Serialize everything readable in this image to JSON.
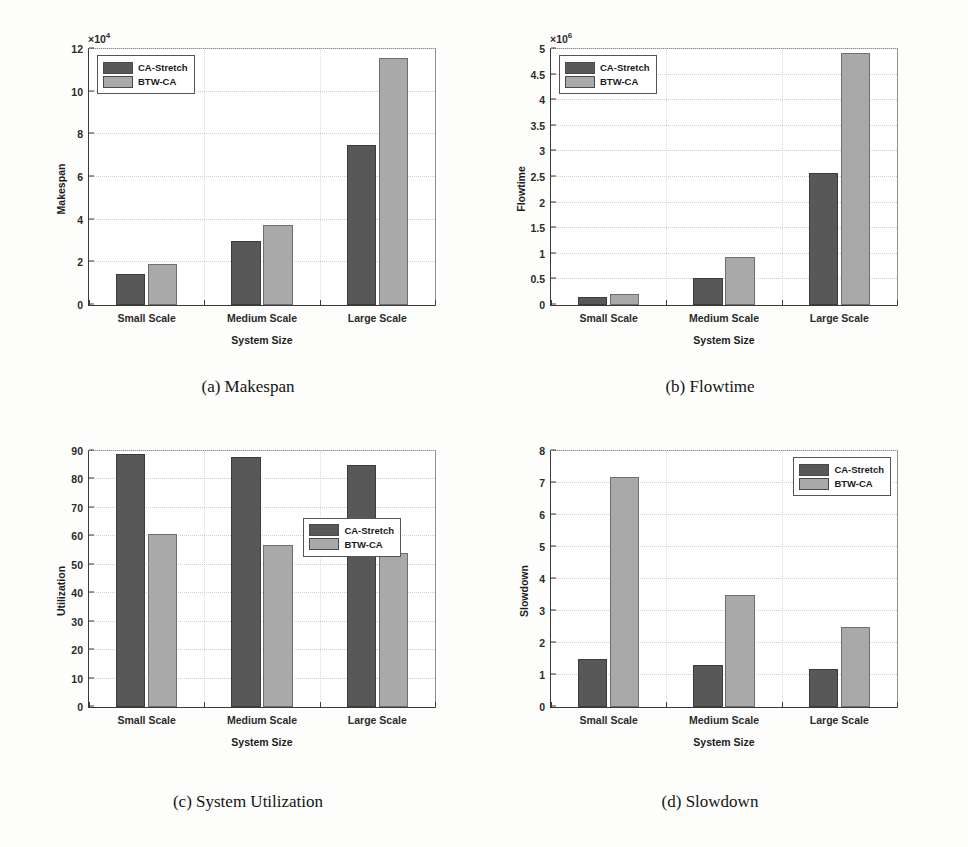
{
  "figure": {
    "panels": [
      {
        "id": "a",
        "caption": "(a) Makespan",
        "chart_data": {
          "type": "bar",
          "title": "",
          "xlabel": "System Size",
          "ylabel": "Makespan",
          "categories": [
            "Small Scale",
            "Medium Scale",
            "Large Scale"
          ],
          "series": [
            {
              "name": "CA-Stretch",
              "values": [
                14500,
                30000,
                75000
              ],
              "color": "#585858"
            },
            {
              "name": "BTW-CA",
              "values": [
                19000,
                37500,
                116000
              ],
              "color": "#a9a9a9"
            }
          ],
          "ylim": [
            0,
            120000
          ],
          "yticks": [
            0,
            20000,
            40000,
            60000,
            80000,
            100000,
            120000
          ],
          "ytick_labels": [
            "0",
            "2",
            "4",
            "6",
            "8",
            "10",
            "12"
          ],
          "y_exponent_label": "×10",
          "y_exponent_value": "4",
          "grid": true,
          "legend_position": "top-left"
        }
      },
      {
        "id": "b",
        "caption": "(b) Flowtime",
        "chart_data": {
          "type": "bar",
          "title": "",
          "xlabel": "System Size",
          "ylabel": "Flowtime",
          "categories": [
            "Small Scale",
            "Medium Scale",
            "Large Scale"
          ],
          "series": [
            {
              "name": "CA-Stretch",
              "values": [
                160000,
                530000,
                2580000
              ],
              "color": "#585858"
            },
            {
              "name": "BTW-CA",
              "values": [
                220000,
                940000,
                4920000
              ],
              "color": "#a9a9a9"
            }
          ],
          "ylim": [
            0,
            5000000
          ],
          "yticks": [
            0,
            500000,
            1000000,
            1500000,
            2000000,
            2500000,
            3000000,
            3500000,
            4000000,
            4500000,
            5000000
          ],
          "ytick_labels": [
            "0",
            "0.5",
            "1",
            "1.5",
            "2",
            "2.5",
            "3",
            "3.5",
            "4",
            "4.5",
            "5"
          ],
          "y_exponent_label": "×10",
          "y_exponent_value": "6",
          "grid": true,
          "legend_position": "top-left"
        }
      },
      {
        "id": "c",
        "caption": "(c) System Utilization",
        "chart_data": {
          "type": "bar",
          "title": "",
          "xlabel": "System Size",
          "ylabel": "Utilization",
          "categories": [
            "Small Scale",
            "Medium Scale",
            "Large Scale"
          ],
          "series": [
            {
              "name": "CA-Stretch",
              "values": [
                89,
                88,
                85
              ],
              "color": "#585858"
            },
            {
              "name": "BTW-CA",
              "values": [
                61,
                57,
                54
              ],
              "color": "#a9a9a9"
            }
          ],
          "ylim": [
            0,
            90
          ],
          "yticks": [
            0,
            10,
            20,
            30,
            40,
            50,
            60,
            70,
            80,
            90
          ],
          "ytick_labels": [
            "0",
            "10",
            "20",
            "30",
            "40",
            "50",
            "60",
            "70",
            "80",
            "90"
          ],
          "y_exponent_label": "",
          "y_exponent_value": "",
          "grid": true,
          "legend_position": "middle-right"
        }
      },
      {
        "id": "d",
        "caption": "(d) Slowdown",
        "chart_data": {
          "type": "bar",
          "title": "",
          "xlabel": "System Size",
          "ylabel": "Slowdown",
          "categories": [
            "Small Scale",
            "Medium Scale",
            "Large Scale"
          ],
          "series": [
            {
              "name": "CA-Stretch",
              "values": [
                1.5,
                1.3,
                1.2
              ],
              "color": "#585858"
            },
            {
              "name": "BTW-CA",
              "values": [
                7.2,
                3.5,
                2.5
              ],
              "color": "#a9a9a9"
            }
          ],
          "ylim": [
            0,
            8
          ],
          "yticks": [
            0,
            1,
            2,
            3,
            4,
            5,
            6,
            7,
            8
          ],
          "ytick_labels": [
            "0",
            "1",
            "2",
            "3",
            "4",
            "5",
            "6",
            "7",
            "8"
          ],
          "y_exponent_label": "",
          "y_exponent_value": "",
          "grid": true,
          "legend_position": "top-right"
        }
      }
    ],
    "colors": {
      "series1": "#585858",
      "series2": "#a9a9a9",
      "axis": "#3a3a3a",
      "grid": "#d0d0d0",
      "background": "#fdfdfc"
    }
  }
}
